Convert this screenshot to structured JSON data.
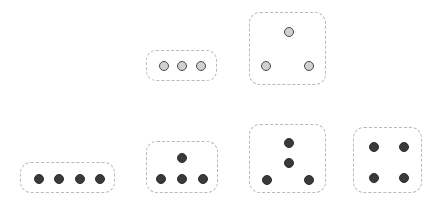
{
  "canvas": {
    "width": 436,
    "height": 202,
    "background": "#ffffff"
  },
  "style": {
    "card_border_color": "#b9b9b9",
    "card_border_style": "dashed",
    "light_dot_fill": "#d0d0d0",
    "light_dot_stroke": "#4a4a4a",
    "dark_dot_fill": "#3a3a3a",
    "dark_dot_stroke": "#2e2e2e"
  },
  "groups": [
    {
      "id": "group-top-middle",
      "row": "top",
      "label": "three-in-a-row",
      "dot_count": 3,
      "dot_color": "light",
      "dot_diameter": 10,
      "box": {
        "x": 146,
        "y": 50,
        "width": 71,
        "height": 31,
        "radius": 10
      },
      "dots": [
        {
          "cx": 163,
          "cy": 65
        },
        {
          "cx": 181,
          "cy": 65
        },
        {
          "cx": 200,
          "cy": 65
        }
      ]
    },
    {
      "id": "group-top-right",
      "row": "top",
      "label": "triangle-three",
      "dot_count": 3,
      "dot_color": "light",
      "dot_diameter": 10,
      "box": {
        "x": 249,
        "y": 12,
        "width": 77,
        "height": 73,
        "radius": 11
      },
      "dots": [
        {
          "cx": 288,
          "cy": 31
        },
        {
          "cx": 265,
          "cy": 65
        },
        {
          "cx": 308,
          "cy": 65
        }
      ]
    },
    {
      "id": "group-bottom-left",
      "row": "bottom",
      "label": "four-in-a-row",
      "dot_count": 4,
      "dot_color": "dark",
      "dot_diameter": 10,
      "box": {
        "x": 20,
        "y": 162,
        "width": 95,
        "height": 31,
        "radius": 11
      },
      "dots": [
        {
          "cx": 38,
          "cy": 178
        },
        {
          "cx": 58,
          "cy": 178
        },
        {
          "cx": 79,
          "cy": 178
        },
        {
          "cx": 99,
          "cy": 178
        }
      ]
    },
    {
      "id": "group-bottom-second",
      "row": "bottom",
      "label": "one-over-three",
      "dot_count": 4,
      "dot_color": "dark",
      "dot_diameter": 10,
      "box": {
        "x": 146,
        "y": 141,
        "width": 72,
        "height": 52,
        "radius": 11
      },
      "dots": [
        {
          "cx": 181,
          "cy": 157
        },
        {
          "cx": 160,
          "cy": 178
        },
        {
          "cx": 181,
          "cy": 178
        },
        {
          "cx": 202,
          "cy": 178
        }
      ]
    },
    {
      "id": "group-bottom-third",
      "row": "bottom",
      "label": "two-over-two-split",
      "dot_count": 4,
      "dot_color": "dark",
      "dot_diameter": 10,
      "box": {
        "x": 249,
        "y": 124,
        "width": 77,
        "height": 69,
        "radius": 11
      },
      "dots": [
        {
          "cx": 288,
          "cy": 142
        },
        {
          "cx": 288,
          "cy": 162
        },
        {
          "cx": 266,
          "cy": 179
        },
        {
          "cx": 308,
          "cy": 179
        }
      ]
    },
    {
      "id": "group-bottom-right",
      "row": "bottom",
      "label": "square-four",
      "dot_count": 4,
      "dot_color": "dark",
      "dot_diameter": 10,
      "box": {
        "x": 353,
        "y": 127,
        "width": 69,
        "height": 66,
        "radius": 11
      },
      "dots": [
        {
          "cx": 373,
          "cy": 146
        },
        {
          "cx": 403,
          "cy": 146
        },
        {
          "cx": 373,
          "cy": 177
        },
        {
          "cx": 403,
          "cy": 177
        }
      ]
    }
  ]
}
